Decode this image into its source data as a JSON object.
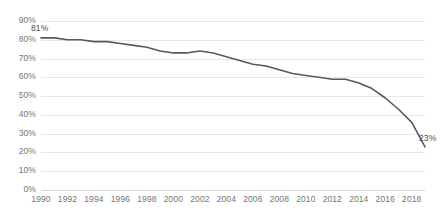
{
  "chart_data": {
    "type": "line",
    "title": "",
    "subtitle": "",
    "xlabel": "",
    "ylabel": "",
    "grid": true,
    "legend": false,
    "legend_position": "none",
    "line_color": "#595959",
    "gridline_color": "#e8e8e8",
    "tick_label_color": "#757575",
    "xlim": [
      1990,
      2019
    ],
    "ylim": [
      0,
      90
    ],
    "y_ticks": [
      "0%",
      "10%",
      "20%",
      "30%",
      "40%",
      "50%",
      "60%",
      "70%",
      "80%",
      "90%"
    ],
    "y_tick_values": [
      0,
      10,
      20,
      30,
      40,
      50,
      60,
      70,
      80,
      90
    ],
    "x_ticks": [
      "1990",
      "1992",
      "1994",
      "1996",
      "1998",
      "2000",
      "2002",
      "2004",
      "2006",
      "2008",
      "2010",
      "2012",
      "2014",
      "2016",
      "2018"
    ],
    "x_tick_values": [
      1990,
      1992,
      1994,
      1996,
      1998,
      2000,
      2002,
      2004,
      2006,
      2008,
      2010,
      2012,
      2014,
      2016,
      2018
    ],
    "x": [
      1990,
      1991,
      1992,
      1993,
      1994,
      1995,
      1996,
      1997,
      1998,
      1999,
      2000,
      2001,
      2002,
      2003,
      2004,
      2005,
      2006,
      2007,
      2008,
      2009,
      2010,
      2011,
      2012,
      2013,
      2014,
      2015,
      2016,
      2017,
      2018,
      2019
    ],
    "values": [
      81,
      81,
      80,
      80,
      79,
      79,
      78,
      77,
      76,
      74,
      73,
      73,
      74,
      73,
      71,
      69,
      67,
      66,
      64,
      62,
      61,
      60,
      59,
      59,
      57,
      54,
      49,
      43,
      36,
      23
    ],
    "series": [
      {
        "name": "Series 1",
        "values": [
          81,
          81,
          80,
          80,
          79,
          79,
          78,
          77,
          76,
          74,
          73,
          73,
          74,
          73,
          71,
          69,
          67,
          66,
          64,
          62,
          61,
          60,
          59,
          59,
          57,
          54,
          49,
          43,
          36,
          23
        ]
      }
    ],
    "annotations": [
      {
        "name": "start-value-label",
        "text": "81%",
        "x": 1990,
        "y": 81
      },
      {
        "name": "end-value-label",
        "text": "23%",
        "x": 2019,
        "y": 23
      }
    ]
  }
}
